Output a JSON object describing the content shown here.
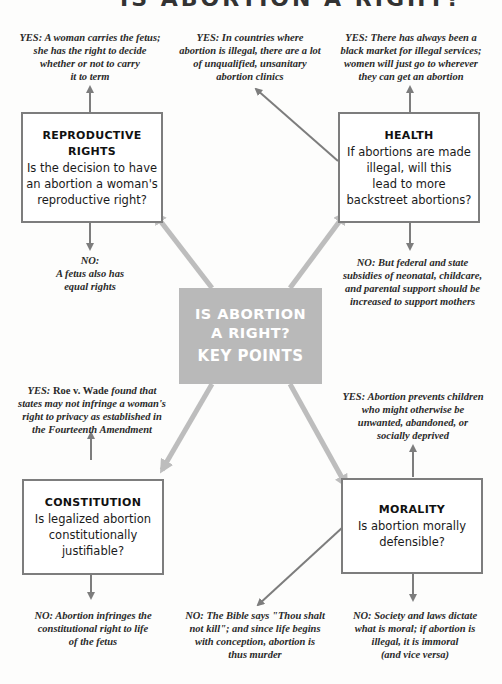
{
  "title": "IS ABORTION A RIGHT?",
  "center": {
    "line1": "IS ABORTION",
    "line2": "A RIGHT?",
    "line3": "KEY POINTS"
  },
  "colors": {
    "box_border": "#7d7d7d",
    "center_fill": "#b9b9b9",
    "arrow_light": "#bdbdbd",
    "arrow_dark": "#7d7d7d"
  },
  "topics": {
    "reproductive": {
      "title_l1": "REPRODUCTIVE",
      "title_l2": "RIGHTS",
      "question_l1": "Is the decision to have",
      "question_l2": "an abortion a woman's",
      "question_l3": "reproductive right?",
      "yes": [
        "YES: A woman carries the fetus;",
        "she has the right to decide",
        "whether or not to carry",
        "it to term"
      ],
      "no": [
        "NO:",
        "A fetus also has",
        "equal rights"
      ]
    },
    "health": {
      "title": "HEALTH",
      "question_l1": "If abortions are made",
      "question_l2": "illegal, will this",
      "question_l3": "lead to more",
      "question_l4": "backstreet abortions?",
      "yes_a": [
        "YES: In countries where",
        "abortion is illegal, there are a lot",
        "of unqualified, unsanitary",
        "abortion clinics"
      ],
      "yes_b": [
        "YES: There has always been a",
        "black market for illegal services;",
        "women will just go to wherever",
        "they can get an abortion"
      ],
      "no": [
        "NO: But federal and state",
        "subsidies of neonatal, childcare,",
        "and parental support should be",
        "increased to support mothers"
      ]
    },
    "constitution": {
      "title": "CONSTITUTION",
      "question_l1": "Is legalized abortion",
      "question_l2": "constitutionally",
      "question_l3": "justifiable?",
      "yes": [
        "YES: Roe v. Wade found that",
        "states may not infringe a woman's",
        "right to privacy as established in",
        "the Fourteenth Amendment"
      ],
      "no": [
        "NO: Abortion infringes the",
        "constitutional right to life",
        "of the fetus"
      ]
    },
    "morality": {
      "title": "MORALITY",
      "question_l1": "Is abortion morally",
      "question_l2": "defensible?",
      "yes": [
        "YES: Abortion prevents children",
        "who might otherwise be",
        "unwanted, abandoned, or",
        "socially deprived"
      ],
      "no_a": [
        "NO: The Bible says \"Thou shalt",
        "not kill\"; and since life begins",
        "with conception, abortion is",
        "thus murder"
      ],
      "no_b": [
        "NO: Society and laws dictate",
        "what is moral; if abortion is",
        "illegal, it is immoral",
        "(and vice versa)"
      ]
    }
  }
}
